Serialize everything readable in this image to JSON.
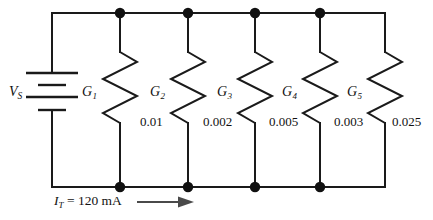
{
  "figure": {
    "type": "schematic",
    "source": {
      "symbol": "battery-cell",
      "label": "V",
      "label_subscript": "S"
    },
    "current": {
      "symbol": "I",
      "subscript": "T",
      "equals": "=",
      "value": "120",
      "unit": "mA",
      "text": "I_T = 120 mA",
      "direction": "right",
      "arrow": "right-arrow-icon"
    },
    "branches": [
      {
        "label": "G",
        "subscript": "1",
        "value": "0.01"
      },
      {
        "label": "G",
        "subscript": "2",
        "value": "0.002"
      },
      {
        "label": "G",
        "subscript": "3",
        "value": "0.005"
      },
      {
        "label": "G",
        "subscript": "4",
        "value": "0.003"
      },
      {
        "label": "G",
        "subscript": "5",
        "value": "0.025"
      }
    ],
    "colors": {
      "wire": "#1a1a1a",
      "node": "#111111",
      "arrow": "#4a4a4a",
      "background": "#ffffff",
      "text": "#111111"
    },
    "node_count_top": 4,
    "node_count_bottom": 4
  }
}
